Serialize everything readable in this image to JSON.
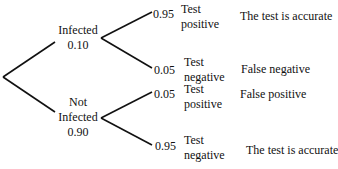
{
  "tree": {
    "root": {
      "x": 3,
      "y": 77
    },
    "level1": [
      {
        "label_line1": "Infected",
        "label_line2": "",
        "prob": "0.10",
        "line": {
          "x1": 3,
          "y1": 77,
          "x2": 55,
          "y2": 42
        }
      },
      {
        "label_line1": "Not",
        "label_line2": "Infected",
        "prob": "0.90",
        "line": {
          "x1": 3,
          "y1": 77,
          "x2": 55,
          "y2": 112
        }
      }
    ],
    "level2": [
      {
        "prob": "0.95",
        "outcome_line1": "Test",
        "outcome_line2": "positive",
        "interpretation": "The test is accurate",
        "line": {
          "x1": 101,
          "y1": 38,
          "x2": 152,
          "y2": 12
        }
      },
      {
        "prob": "0.05",
        "outcome_line1": "Test",
        "outcome_line2": "negative",
        "interpretation": "False negative",
        "line": {
          "x1": 101,
          "y1": 38,
          "x2": 152,
          "y2": 68
        }
      },
      {
        "prob": "0.05",
        "outcome_line1": "Test",
        "outcome_line2": "positive",
        "interpretation": "False positive",
        "line": {
          "x1": 101,
          "y1": 118,
          "x2": 152,
          "y2": 92
        }
      },
      {
        "prob": "0.95",
        "outcome_line1": "Test",
        "outcome_line2": "negative",
        "interpretation": "The test is accurate",
        "line": {
          "x1": 101,
          "y1": 118,
          "x2": 152,
          "y2": 145
        }
      }
    ]
  },
  "colors": {
    "line": "#111111",
    "background": "#ffffff"
  }
}
